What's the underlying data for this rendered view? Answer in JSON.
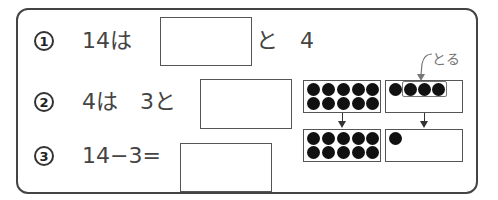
{
  "problems": [
    {
      "number": "1",
      "text_before": "14は",
      "text_after": "と　4",
      "answer": ""
    },
    {
      "number": "2",
      "text_before": "4は　3と",
      "answer": ""
    },
    {
      "number": "3",
      "text_before": "14−3=",
      "answer": ""
    }
  ],
  "diagram": {
    "annotation": "とる",
    "top_left_frame": {
      "dots": 10
    },
    "top_right_frame": {
      "dots": 4,
      "taken": 3
    },
    "bottom_left_frame": {
      "dots": 10
    },
    "bottom_right_frame": {
      "dots": 1
    }
  }
}
